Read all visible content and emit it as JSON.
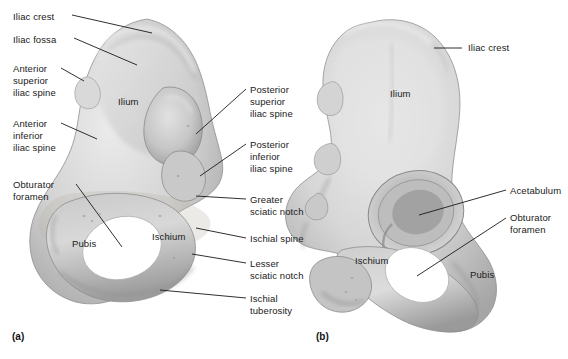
{
  "figure": {
    "background_color": "#ffffff",
    "bone_fill": "#d2d2d2",
    "bone_shadow": "#8d8d8d",
    "bone_highlight": "#ececec",
    "leader_color": "#1a1a1a",
    "text_color": "#1a1a1a"
  },
  "panels": [
    {
      "id": "a",
      "caption": "(a)",
      "view": "medial-view-left-bone"
    },
    {
      "id": "b",
      "caption": "(b)",
      "view": "lateral-view-right-bone"
    }
  ],
  "labels_left": [
    {
      "name": "iliac-crest",
      "lines": [
        "Iliac crest"
      ]
    },
    {
      "name": "iliac-fossa",
      "lines": [
        "Iliac fossa"
      ]
    },
    {
      "name": "anterior-superior-iliac-spine",
      "lines": [
        "Anterior",
        "superior",
        "iliac spine"
      ]
    },
    {
      "name": "anterior-inferior-iliac-spine",
      "lines": [
        "Anterior",
        "inferior",
        "iliac spine"
      ]
    },
    {
      "name": "obturator-foramen",
      "lines": [
        "Obturator",
        "foramen"
      ]
    }
  ],
  "labels_middle": [
    {
      "name": "posterior-superior-iliac-spine",
      "lines": [
        "Posterior",
        "superior",
        "iliac spine"
      ]
    },
    {
      "name": "posterior-inferior-iliac-spine",
      "lines": [
        "Posterior",
        "inferior",
        "iliac spine"
      ]
    },
    {
      "name": "greater-sciatic-notch",
      "lines": [
        "Greater",
        "sciatic notch"
      ]
    },
    {
      "name": "ischial-spine",
      "lines": [
        "Ischial spine"
      ]
    },
    {
      "name": "lesser-sciatic-notch",
      "lines": [
        "Lesser",
        "sciatic notch"
      ]
    },
    {
      "name": "ischial-tuberosity",
      "lines": [
        "Ischial",
        "tuberosity"
      ]
    }
  ],
  "labels_right": [
    {
      "name": "iliac-crest-right",
      "lines": [
        "Iliac crest"
      ]
    },
    {
      "name": "acetabulum",
      "lines": [
        "Acetabulum"
      ]
    },
    {
      "name": "obturator-foramen-right",
      "lines": [
        "Obturator",
        "foramen"
      ]
    }
  ],
  "bone_region_labels": [
    {
      "name": "ilium-left",
      "text": "Ilium"
    },
    {
      "name": "pubis-left",
      "text": "Pubis"
    },
    {
      "name": "ischium-left",
      "text": "Ischium"
    },
    {
      "name": "ilium-right",
      "text": "Ilium"
    },
    {
      "name": "ischium-right",
      "text": "Ischium"
    },
    {
      "name": "pubis-right",
      "text": "Pubis"
    }
  ],
  "text": {
    "iliac_crest": "Iliac crest",
    "iliac_fossa": "Iliac fossa",
    "asis_1": "Anterior",
    "asis_2": "superior",
    "asis_3": "iliac spine",
    "aiis_1": "Anterior",
    "aiis_2": "inferior",
    "aiis_3": "iliac spine",
    "obturator_1": "Obturator",
    "obturator_2": "foramen",
    "psis_1": "Posterior",
    "psis_2": "superior",
    "psis_3": "iliac spine",
    "piis_1": "Posterior",
    "piis_2": "inferior",
    "piis_3": "iliac spine",
    "greater_1": "Greater",
    "greater_2": "sciatic notch",
    "ischial_spine": "Ischial spine",
    "lesser_1": "Lesser",
    "lesser_2": "sciatic notch",
    "tuberosity_1": "Ischial",
    "tuberosity_2": "tuberosity",
    "iliac_crest_r": "Iliac crest",
    "acetabulum": "Acetabulum",
    "obturator_r1": "Obturator",
    "obturator_r2": "foramen",
    "ilium_a": "Ilium",
    "pubis_a": "Pubis",
    "ischium_a": "Ischium",
    "ilium_b": "Ilium",
    "ischium_b": "Ischium",
    "pubis_b": "Pubis",
    "caption_a": "(a)",
    "caption_b": "(b)"
  }
}
